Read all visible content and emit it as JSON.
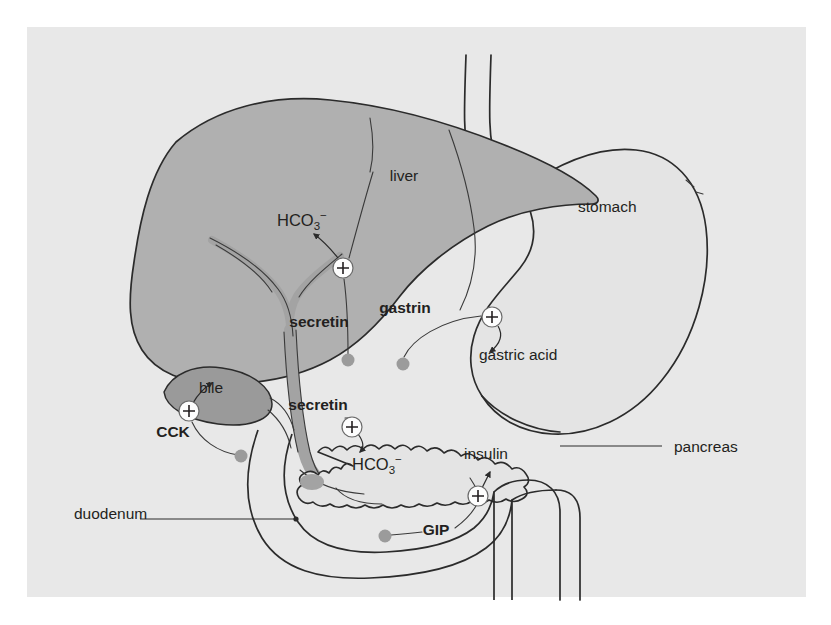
{
  "figure": {
    "background_color": "#ffffff",
    "panel_color": "#e8e8e8",
    "ink_color": "#231f20"
  },
  "palette": {
    "liver_fill": "#b0b0b0",
    "gallbladder_fill": "#9a9a9a",
    "duct_fill": "#a3a3a3",
    "stomach_fill": "#e4e4e4",
    "pancreas_fill": "#e4e4e4",
    "duodenum_fill": "#dedede",
    "cell_dot": "#9b9b9b",
    "plus_circle_fill": "#fdfdfd",
    "outline": "#2b2b2b"
  },
  "organs": [
    {
      "id": "liver",
      "label": "liver",
      "x": 404,
      "y": 181
    },
    {
      "id": "stomach",
      "label": "stomach",
      "x": 578,
      "y": 212
    },
    {
      "id": "pancreas",
      "label": "pancreas",
      "x": 674,
      "y": 452
    },
    {
      "id": "duodenum",
      "label": "duodenum",
      "x": 74,
      "y": 519
    }
  ],
  "hormones": [
    {
      "id": "secretin-liver",
      "label": "secretin",
      "x": 319,
      "y": 327,
      "bold": true
    },
    {
      "id": "gastrin",
      "label": "gastrin",
      "x": 405,
      "y": 313,
      "bold": true
    },
    {
      "id": "secretin-pancreas",
      "label": "secretin",
      "x": 318,
      "y": 410,
      "bold": true
    },
    {
      "id": "cck",
      "label": "CCK",
      "x": 173,
      "y": 437,
      "bold": true
    },
    {
      "id": "gip",
      "label": "GIP",
      "x": 436,
      "y": 535,
      "bold": true
    }
  ],
  "secretions": [
    {
      "id": "hco3-liver",
      "label": "HCO3-",
      "display": "HCO",
      "sub": "3",
      "sup": "−",
      "x": 277,
      "y": 226
    },
    {
      "id": "gastric-acid",
      "label": "gastric acid",
      "display": "gastric acid",
      "x": 479,
      "y": 360
    },
    {
      "id": "bile",
      "label": "bile",
      "display": "bile",
      "x": 199,
      "y": 393
    },
    {
      "id": "hco3-pancreas",
      "label": "HCO3-",
      "display": "HCO",
      "sub": "3",
      "sup": "−",
      "x": 352,
      "y": 470
    },
    {
      "id": "insulin",
      "label": "insulin",
      "display": "insulin",
      "x": 464,
      "y": 459
    }
  ],
  "stimulation_markers": [
    {
      "id": "plus-hco3-liver",
      "symbol": "+",
      "cx": 343,
      "cy": 268,
      "r": 10
    },
    {
      "id": "plus-gastric-acid",
      "symbol": "+",
      "cx": 492,
      "cy": 317,
      "r": 10
    },
    {
      "id": "plus-bile",
      "symbol": "+",
      "cx": 189,
      "cy": 411,
      "r": 10
    },
    {
      "id": "plus-hco3-pancreas",
      "symbol": "+",
      "cx": 352,
      "cy": 427,
      "r": 10
    },
    {
      "id": "plus-insulin",
      "symbol": "+",
      "cx": 478,
      "cy": 496,
      "r": 10
    }
  ],
  "endocrine_cells": [
    {
      "id": "cell-secretin-liver",
      "cx": 348,
      "cy": 360,
      "r": 6.5
    },
    {
      "id": "cell-gastrin",
      "cx": 403,
      "cy": 364,
      "r": 6.5
    },
    {
      "id": "cell-cck",
      "cx": 241,
      "cy": 456,
      "r": 6.5
    },
    {
      "id": "cell-gip",
      "cx": 385,
      "cy": 536,
      "r": 6.5
    }
  ]
}
